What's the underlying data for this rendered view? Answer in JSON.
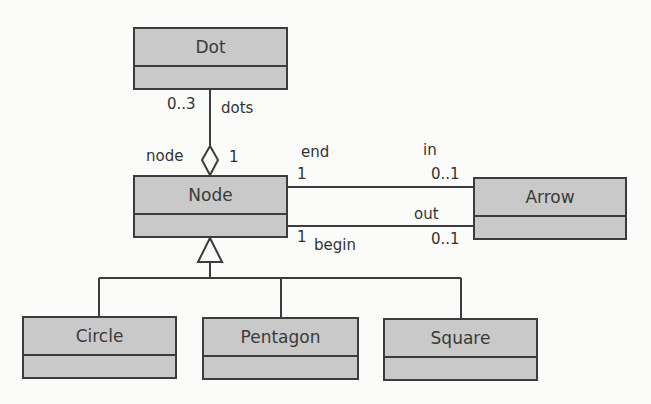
{
  "diagram": {
    "type": "UML class diagram",
    "colors": {
      "box_fill": "#c9c9c9",
      "box_border": "#3c3c3c",
      "line": "#3c3c3c",
      "text": "#333333",
      "background": "#fbfbfa"
    },
    "classes": [
      {
        "id": "dot",
        "name": "Dot"
      },
      {
        "id": "node",
        "name": "Node"
      },
      {
        "id": "arrow",
        "name": "Arrow"
      },
      {
        "id": "circle",
        "name": "Circle"
      },
      {
        "id": "pentagon",
        "name": "Pentagon"
      },
      {
        "id": "square",
        "name": "Square"
      }
    ],
    "relations": [
      {
        "kind": "aggregation",
        "from": "Node",
        "to": "Dot",
        "labels": {
          "dot_multiplicity": "0..3",
          "dot_role": "dots",
          "node_role": "node",
          "node_multiplicity": "1"
        }
      },
      {
        "kind": "association",
        "from": "Node",
        "to": "Arrow",
        "labels": {
          "node_role": "end",
          "node_multiplicity": "1",
          "arrow_role": "in",
          "arrow_multiplicity": "0..1"
        }
      },
      {
        "kind": "association",
        "from": "Node",
        "to": "Arrow",
        "labels": {
          "node_role": "begin",
          "node_multiplicity": "1",
          "arrow_role": "out",
          "arrow_multiplicity": "0..1"
        }
      },
      {
        "kind": "generalization",
        "parent": "Node",
        "children": [
          "Circle",
          "Pentagon",
          "Square"
        ]
      }
    ]
  }
}
